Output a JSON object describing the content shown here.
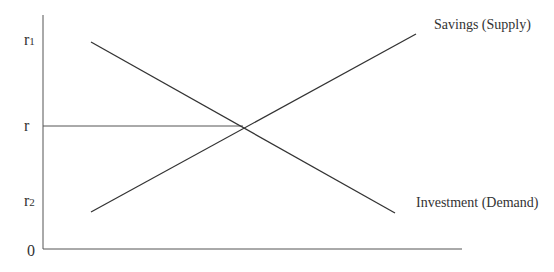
{
  "diagram": {
    "type": "loanable-funds-market",
    "axis_labels": {
      "y_ticks": [
        {
          "label": "r",
          "sub": "1",
          "y": 42
        },
        {
          "label": "r",
          "sub": "",
          "y": 126
        },
        {
          "label": "r",
          "sub": "2",
          "y": 212
        },
        {
          "label": "0",
          "sub": "",
          "y": 249
        }
      ]
    },
    "curves": {
      "supply": {
        "label": "Savings (Supply)",
        "from": [
          91,
          212
        ],
        "to": [
          416,
          34
        ]
      },
      "demand": {
        "label": "Investment (Demand)",
        "from": [
          91,
          42
        ],
        "to": [
          395,
          213
        ]
      }
    },
    "equilibrium": {
      "label": "r",
      "x": 243,
      "y": 126
    },
    "colors": {
      "line": "#333333",
      "text": "#333333",
      "background": "#ffffff"
    }
  }
}
